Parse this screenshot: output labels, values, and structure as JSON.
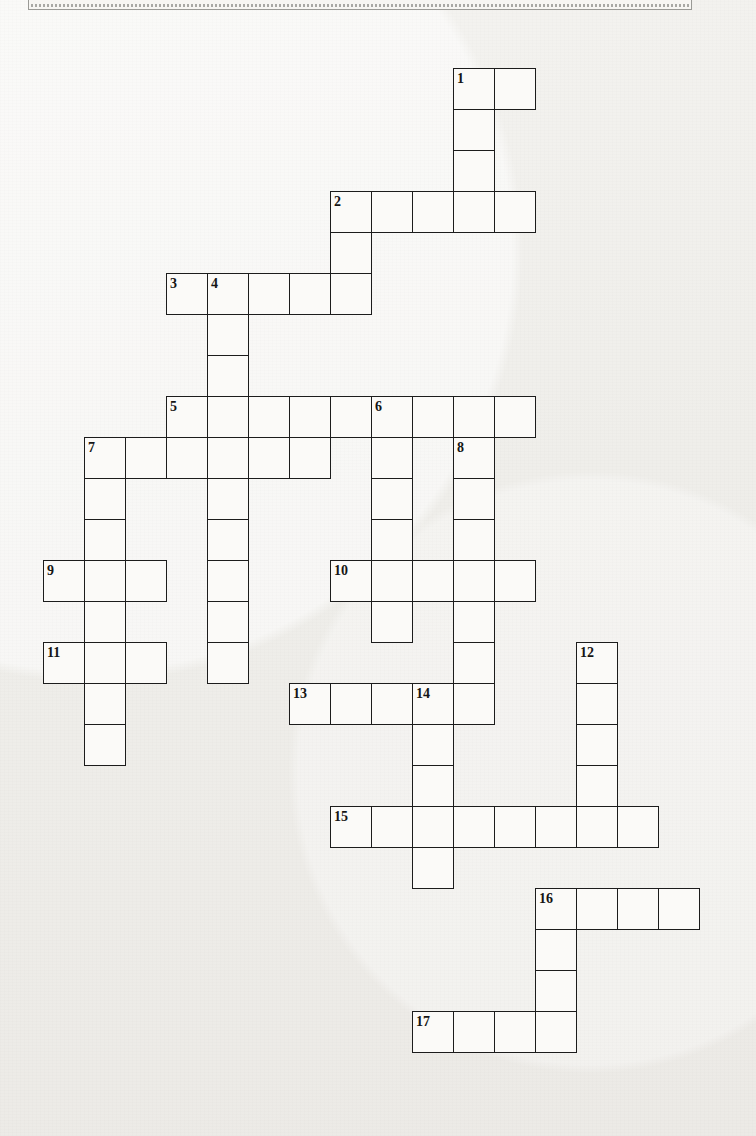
{
  "page": {
    "background_color": "#f1f0ed",
    "cell_fill_color": "#fbfaf8",
    "cell_border_color": "#1c1c1c",
    "number_color": "#151515"
  },
  "header": {
    "text": "NAME OF THE PUZZLE",
    "visible": "partially cut off at top edge"
  },
  "grid": {
    "cell_size": 41,
    "origin_x": 43,
    "origin_y": 68,
    "columns": 17,
    "rows": 26,
    "cells": [
      {
        "c": 10,
        "r": 0
      },
      {
        "c": 11,
        "r": 0
      },
      {
        "c": 10,
        "r": 1
      },
      {
        "c": 10,
        "r": 2
      },
      {
        "c": 7,
        "r": 3
      },
      {
        "c": 8,
        "r": 3
      },
      {
        "c": 9,
        "r": 3
      },
      {
        "c": 10,
        "r": 3
      },
      {
        "c": 11,
        "r": 3
      },
      {
        "c": 7,
        "r": 4
      },
      {
        "c": 3,
        "r": 5
      },
      {
        "c": 4,
        "r": 5
      },
      {
        "c": 5,
        "r": 5
      },
      {
        "c": 6,
        "r": 5
      },
      {
        "c": 7,
        "r": 5
      },
      {
        "c": 4,
        "r": 6
      },
      {
        "c": 4,
        "r": 7
      },
      {
        "c": 3,
        "r": 8
      },
      {
        "c": 4,
        "r": 8
      },
      {
        "c": 5,
        "r": 8
      },
      {
        "c": 6,
        "r": 8
      },
      {
        "c": 7,
        "r": 8
      },
      {
        "c": 8,
        "r": 8
      },
      {
        "c": 9,
        "r": 8
      },
      {
        "c": 10,
        "r": 8
      },
      {
        "c": 11,
        "r": 8
      },
      {
        "c": 1,
        "r": 9
      },
      {
        "c": 2,
        "r": 9
      },
      {
        "c": 3,
        "r": 9
      },
      {
        "c": 4,
        "r": 9
      },
      {
        "c": 5,
        "r": 9
      },
      {
        "c": 6,
        "r": 9
      },
      {
        "c": 8,
        "r": 9
      },
      {
        "c": 10,
        "r": 9
      },
      {
        "c": 1,
        "r": 10
      },
      {
        "c": 4,
        "r": 10
      },
      {
        "c": 8,
        "r": 10
      },
      {
        "c": 10,
        "r": 10
      },
      {
        "c": 1,
        "r": 11
      },
      {
        "c": 4,
        "r": 11
      },
      {
        "c": 8,
        "r": 11
      },
      {
        "c": 10,
        "r": 11
      },
      {
        "c": 0,
        "r": 12
      },
      {
        "c": 1,
        "r": 12
      },
      {
        "c": 2,
        "r": 12
      },
      {
        "c": 4,
        "r": 12
      },
      {
        "c": 7,
        "r": 12
      },
      {
        "c": 8,
        "r": 12
      },
      {
        "c": 9,
        "r": 12
      },
      {
        "c": 10,
        "r": 12
      },
      {
        "c": 11,
        "r": 12
      },
      {
        "c": 1,
        "r": 13
      },
      {
        "c": 4,
        "r": 13
      },
      {
        "c": 8,
        "r": 13
      },
      {
        "c": 10,
        "r": 13
      },
      {
        "c": 0,
        "r": 14
      },
      {
        "c": 1,
        "r": 14
      },
      {
        "c": 2,
        "r": 14
      },
      {
        "c": 4,
        "r": 14
      },
      {
        "c": 10,
        "r": 14
      },
      {
        "c": 13,
        "r": 14
      },
      {
        "c": 1,
        "r": 15
      },
      {
        "c": 6,
        "r": 15
      },
      {
        "c": 7,
        "r": 15
      },
      {
        "c": 8,
        "r": 15
      },
      {
        "c": 9,
        "r": 15
      },
      {
        "c": 10,
        "r": 15
      },
      {
        "c": 13,
        "r": 15
      },
      {
        "c": 1,
        "r": 16
      },
      {
        "c": 9,
        "r": 16
      },
      {
        "c": 13,
        "r": 16
      },
      {
        "c": 9,
        "r": 17
      },
      {
        "c": 13,
        "r": 17
      },
      {
        "c": 7,
        "r": 18
      },
      {
        "c": 8,
        "r": 18
      },
      {
        "c": 9,
        "r": 18
      },
      {
        "c": 10,
        "r": 18
      },
      {
        "c": 11,
        "r": 18
      },
      {
        "c": 12,
        "r": 18
      },
      {
        "c": 13,
        "r": 18
      },
      {
        "c": 14,
        "r": 18
      },
      {
        "c": 9,
        "r": 19
      },
      {
        "c": 12,
        "r": 20
      },
      {
        "c": 13,
        "r": 20
      },
      {
        "c": 14,
        "r": 20
      },
      {
        "c": 15,
        "r": 20
      },
      {
        "c": 12,
        "r": 21
      },
      {
        "c": 12,
        "r": 22
      },
      {
        "c": 9,
        "r": 23
      },
      {
        "c": 10,
        "r": 23
      },
      {
        "c": 11,
        "r": 23
      },
      {
        "c": 12,
        "r": 23
      }
    ],
    "numbers": [
      {
        "n": "1",
        "c": 10,
        "r": 0
      },
      {
        "n": "2",
        "c": 7,
        "r": 3
      },
      {
        "n": "3",
        "c": 3,
        "r": 5
      },
      {
        "n": "4",
        "c": 4,
        "r": 5
      },
      {
        "n": "5",
        "c": 3,
        "r": 8
      },
      {
        "n": "6",
        "c": 8,
        "r": 8
      },
      {
        "n": "7",
        "c": 1,
        "r": 9
      },
      {
        "n": "8",
        "c": 10,
        "r": 9
      },
      {
        "n": "9",
        "c": 0,
        "r": 12
      },
      {
        "n": "10",
        "c": 7,
        "r": 12
      },
      {
        "n": "11",
        "c": 0,
        "r": 14
      },
      {
        "n": "12",
        "c": 13,
        "r": 14
      },
      {
        "n": "13",
        "c": 6,
        "r": 15
      },
      {
        "n": "14",
        "c": 9,
        "r": 15
      },
      {
        "n": "15",
        "c": 7,
        "r": 18
      },
      {
        "n": "16",
        "c": 12,
        "r": 20
      },
      {
        "n": "17",
        "c": 9,
        "r": 23
      }
    ],
    "entries": [
      {
        "number": "1",
        "direction": "across",
        "length": 2,
        "start": {
          "c": 10,
          "r": 0
        }
      },
      {
        "number": "1",
        "direction": "down",
        "length": 4,
        "start": {
          "c": 10,
          "r": 0
        }
      },
      {
        "number": "2",
        "direction": "across",
        "length": 5,
        "start": {
          "c": 7,
          "r": 3
        }
      },
      {
        "number": "2",
        "direction": "down",
        "length": 3,
        "start": {
          "c": 7,
          "r": 3
        }
      },
      {
        "number": "3",
        "direction": "across",
        "length": 5,
        "start": {
          "c": 3,
          "r": 5
        }
      },
      {
        "number": "4",
        "direction": "down",
        "length": 10,
        "start": {
          "c": 4,
          "r": 5
        }
      },
      {
        "number": "5",
        "direction": "across",
        "length": 9,
        "start": {
          "c": 3,
          "r": 8
        }
      },
      {
        "number": "6",
        "direction": "down",
        "length": 7,
        "start": {
          "c": 8,
          "r": 8
        }
      },
      {
        "number": "7",
        "direction": "across",
        "length": 6,
        "start": {
          "c": 1,
          "r": 9
        }
      },
      {
        "number": "7",
        "direction": "down",
        "length": 8,
        "start": {
          "c": 1,
          "r": 9
        }
      },
      {
        "number": "8",
        "direction": "down",
        "length": 7,
        "start": {
          "c": 10,
          "r": 9
        }
      },
      {
        "number": "9",
        "direction": "across",
        "length": 3,
        "start": {
          "c": 0,
          "r": 12
        }
      },
      {
        "number": "10",
        "direction": "across",
        "length": 5,
        "start": {
          "c": 7,
          "r": 12
        }
      },
      {
        "number": "11",
        "direction": "across",
        "length": 3,
        "start": {
          "c": 0,
          "r": 14
        }
      },
      {
        "number": "12",
        "direction": "down",
        "length": 5,
        "start": {
          "c": 13,
          "r": 14
        }
      },
      {
        "number": "13",
        "direction": "across",
        "length": 5,
        "start": {
          "c": 6,
          "r": 15
        }
      },
      {
        "number": "14",
        "direction": "down",
        "length": 5,
        "start": {
          "c": 9,
          "r": 15
        }
      },
      {
        "number": "15",
        "direction": "across",
        "length": 8,
        "start": {
          "c": 7,
          "r": 18
        }
      },
      {
        "number": "16",
        "direction": "across",
        "length": 4,
        "start": {
          "c": 12,
          "r": 20
        }
      },
      {
        "number": "16",
        "direction": "down",
        "length": 4,
        "start": {
          "c": 12,
          "r": 20
        }
      },
      {
        "number": "17",
        "direction": "across",
        "length": 4,
        "start": {
          "c": 9,
          "r": 23
        }
      }
    ],
    "letters": []
  }
}
